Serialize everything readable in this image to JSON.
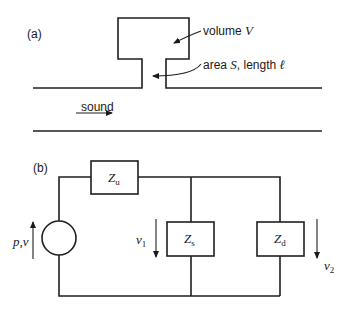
{
  "panel_a": {
    "label": "(a)",
    "volume_label": "volume ",
    "volume_symbol": "V",
    "neck_label_prefix": "area ",
    "neck_area_symbol": "S",
    "neck_label_mid": ", length ",
    "neck_length_symbol": "ℓ",
    "sound_label": "sound"
  },
  "panel_b": {
    "label": "(b)",
    "source_label": "p,v",
    "Zu": {
      "main": "Z",
      "sub": "u"
    },
    "Zs": {
      "main": "Z",
      "sub": "s"
    },
    "Zd": {
      "main": "Z",
      "sub": "d"
    },
    "v1": {
      "main": "v",
      "sub": "1"
    },
    "v2": {
      "main": "v",
      "sub": "2"
    }
  }
}
